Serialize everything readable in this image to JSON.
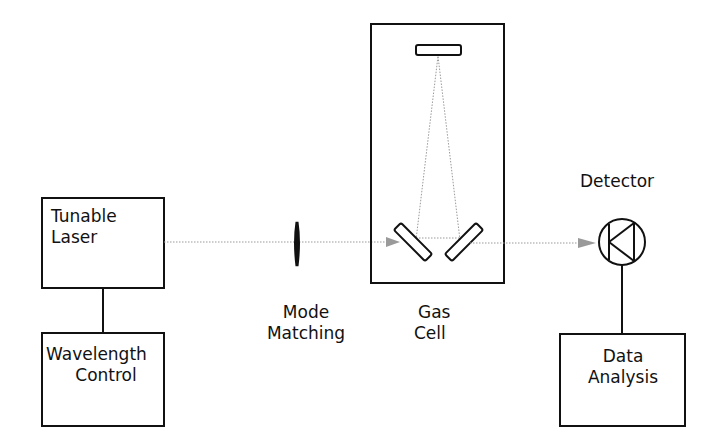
{
  "diagram": {
    "components": {
      "tunable_laser": {
        "line1": "Tunable",
        "line2": "Laser"
      },
      "wavelength_control": {
        "line1": "Wavelength",
        "line2": "Control"
      },
      "mode_matching": {
        "line1": "Mode",
        "line2": "Matching"
      },
      "gas_cell": {
        "line1": "Gas",
        "line2": "Cell"
      },
      "detector": {
        "label": "Detector"
      },
      "data_analysis": {
        "line1": "Data",
        "line2": "Analysis"
      }
    },
    "colors": {
      "stroke": "#111111",
      "beam": "#9a9a9a",
      "background": "#ffffff"
    }
  }
}
